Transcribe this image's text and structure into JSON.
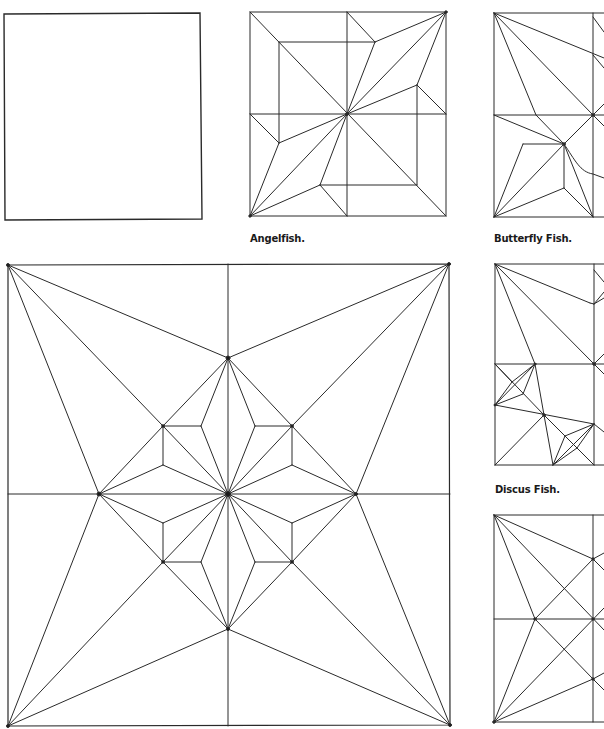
{
  "figure": {
    "line_color": "#2a2a2a",
    "background": "#ffffff"
  },
  "diagrams": [
    {
      "id": "blank-square",
      "caption": ""
    },
    {
      "id": "angelfish",
      "caption": "Angelfish."
    },
    {
      "id": "butterfly-fish",
      "caption": "Butterfly Fish."
    },
    {
      "id": "discus-fish",
      "caption": "Discus Fish."
    },
    {
      "id": "large-crease-pattern",
      "caption": ""
    },
    {
      "id": "lower-right-pattern",
      "caption": ""
    }
  ],
  "captions": {
    "angelfish": "Angelfish.",
    "butterfly": "Butterfly Fish.",
    "discus": "Discus Fish."
  }
}
